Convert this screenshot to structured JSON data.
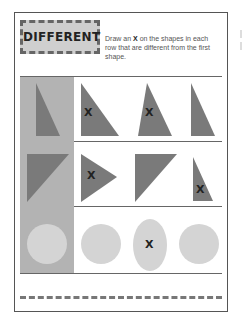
{
  "worksheet": {
    "title": "DIFFERENT",
    "instructions": {
      "before": "Draw an ",
      "emphasis": "X",
      "after": " on the shapes in each row that are different from the first shape."
    },
    "rows": [
      {
        "name": "right-triangles",
        "shapes": [
          {
            "type": "right-triangle-tall",
            "marked": false,
            "reference": true
          },
          {
            "type": "right-triangle-wide",
            "marked": true,
            "mark": "X"
          },
          {
            "type": "isosceles-triangle",
            "marked": true,
            "mark": "X"
          },
          {
            "type": "right-triangle-tall",
            "marked": false
          }
        ]
      },
      {
        "name": "corner-triangles",
        "shapes": [
          {
            "type": "right-triangle-top-left",
            "marked": false,
            "reference": true
          },
          {
            "type": "triangle-pointing-right",
            "marked": true,
            "mark": "X"
          },
          {
            "type": "right-triangle-top-left",
            "marked": false
          },
          {
            "type": "right-triangle-small",
            "marked": true,
            "mark": "X"
          }
        ]
      },
      {
        "name": "circles",
        "shapes": [
          {
            "type": "circle",
            "marked": false,
            "reference": true
          },
          {
            "type": "circle",
            "marked": false
          },
          {
            "type": "oval",
            "marked": true,
            "mark": "X"
          },
          {
            "type": "circle",
            "marked": false
          }
        ]
      }
    ],
    "colors": {
      "shape_dark": "#7a7a7a",
      "shape_light": "#d4d4d4",
      "reference_column": "#b3b3b3",
      "frame": "#555555"
    }
  }
}
